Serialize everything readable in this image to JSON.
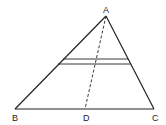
{
  "diagram": {
    "type": "geometry",
    "points": {
      "A": {
        "label": "A",
        "x": 106,
        "y": 16
      },
      "B": {
        "label": "B",
        "x": 15,
        "y": 109
      },
      "C": {
        "label": "C",
        "x": 154,
        "y": 109
      },
      "D": {
        "label": "D",
        "x": 85,
        "y": 109
      }
    },
    "segments": [
      {
        "from": "A",
        "to": "B",
        "style": "solid"
      },
      {
        "from": "A",
        "to": "C",
        "style": "solid"
      },
      {
        "from": "B",
        "to": "C",
        "style": "solid"
      },
      {
        "from": "A",
        "to": "D",
        "style": "dashed"
      }
    ],
    "parallel_lines": [
      {
        "x1": 63,
        "y1": 59,
        "x2": 128,
        "y2": 59
      },
      {
        "x1": 58,
        "y1": 64,
        "x2": 131,
        "y2": 64
      }
    ],
    "colors": {
      "stroke": "#222222",
      "background": "#ffffff"
    }
  }
}
